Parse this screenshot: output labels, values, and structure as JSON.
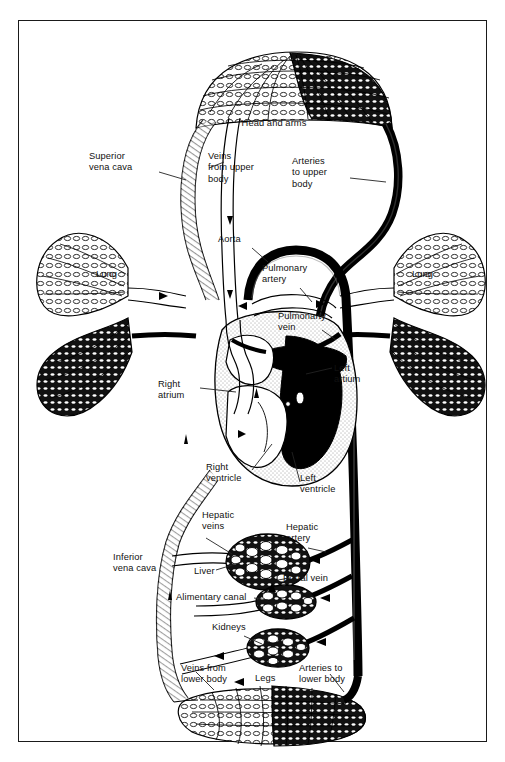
{
  "figure": {
    "frame_border_color": "#1a1a1a",
    "background_color": "#ffffff",
    "ink_color": "#000000",
    "oxygenated_fill": "#000000",
    "deoxygenated_fill": "#ffffff"
  },
  "labels": {
    "head_and_arms": "Head and arms",
    "superior_vena_cava": "Superior\nvena cava",
    "veins_from_upper_body": "Veins\nfrom upper\nbody",
    "arteries_to_upper_body": "Arteries\nto upper\nbody",
    "aorta": "Aorta",
    "pulmonary_artery": "Pulmonary\nartery",
    "pulmonary_vein": "Pulmonarty\nvein",
    "lung_left": "Lung",
    "lung_right": "Lung",
    "right_atrium": "Right\natrium",
    "left_atrium": "Left\nartium",
    "right_ventricle": "Right\nventricle",
    "left_ventricle": "Left\nventricle",
    "hepatic_veins": "Hepatic\nveins",
    "hepatic_artery": "Hepatic\nartery",
    "liver": "Liver",
    "portal_vein": "Portal vein",
    "alimentary_canal": "Alimentary canal",
    "inferior_vena_cava": "Inferior\nvena cava",
    "kidneys": "Kidneys",
    "legs": "Legs",
    "veins_from_lower_body": "Veins from\nlower body",
    "arteries_to_lower_body": "Arteries to\nlower body"
  },
  "capillary_beds": [
    {
      "name": "head-and-arms",
      "label": "Head and arms"
    },
    {
      "name": "lung-left",
      "label": "Lung"
    },
    {
      "name": "lung-right",
      "label": "Lung"
    },
    {
      "name": "liver",
      "label": "Liver"
    },
    {
      "name": "alimentary-canal",
      "label": "Alimentary canal"
    },
    {
      "name": "kidneys",
      "label": "Kidneys"
    },
    {
      "name": "legs",
      "label": "Legs"
    }
  ],
  "flow_arrows": {
    "count": 14,
    "description": "Solid triangular arrowheads indicating direction of blood flow"
  }
}
